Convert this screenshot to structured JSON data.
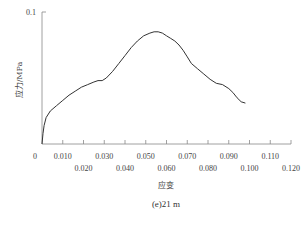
{
  "chart_data": {
    "type": "line",
    "title": "",
    "caption": "(e)21 m",
    "xlabel": "应变",
    "ylabel": "应力/MPa",
    "xlim": [
      0,
      0.12
    ],
    "ylim": [
      0,
      0.1
    ],
    "grid": false,
    "legend": null,
    "x_ticks_upper": [
      "0",
      "0.010",
      "0.030",
      "0.050",
      "0.070",
      "0.090",
      "0.110"
    ],
    "x_ticks_lower": [
      "0.020",
      "0.040",
      "0.060",
      "0.080",
      "0.100",
      "0.120"
    ],
    "y_ticks": [
      "0.1"
    ],
    "series": [
      {
        "name": "stress-strain",
        "x": [
          0.0,
          0.0005,
          0.001,
          0.002,
          0.004,
          0.007,
          0.01,
          0.013,
          0.016,
          0.019,
          0.022,
          0.025,
          0.027,
          0.029,
          0.031,
          0.034,
          0.037,
          0.04,
          0.043,
          0.046,
          0.049,
          0.052,
          0.054,
          0.056,
          0.058,
          0.06,
          0.062,
          0.064,
          0.066,
          0.068,
          0.07,
          0.072,
          0.075,
          0.078,
          0.081,
          0.084,
          0.087,
          0.09,
          0.092,
          0.094,
          0.096,
          0.098
        ],
        "y": [
          0.0,
          0.008,
          0.014,
          0.02,
          0.025,
          0.029,
          0.033,
          0.037,
          0.04,
          0.043,
          0.045,
          0.047,
          0.048,
          0.048,
          0.05,
          0.055,
          0.061,
          0.067,
          0.073,
          0.078,
          0.082,
          0.084,
          0.085,
          0.085,
          0.084,
          0.082,
          0.08,
          0.078,
          0.075,
          0.071,
          0.066,
          0.061,
          0.057,
          0.053,
          0.049,
          0.046,
          0.045,
          0.042,
          0.039,
          0.035,
          0.032,
          0.031
        ]
      }
    ]
  }
}
